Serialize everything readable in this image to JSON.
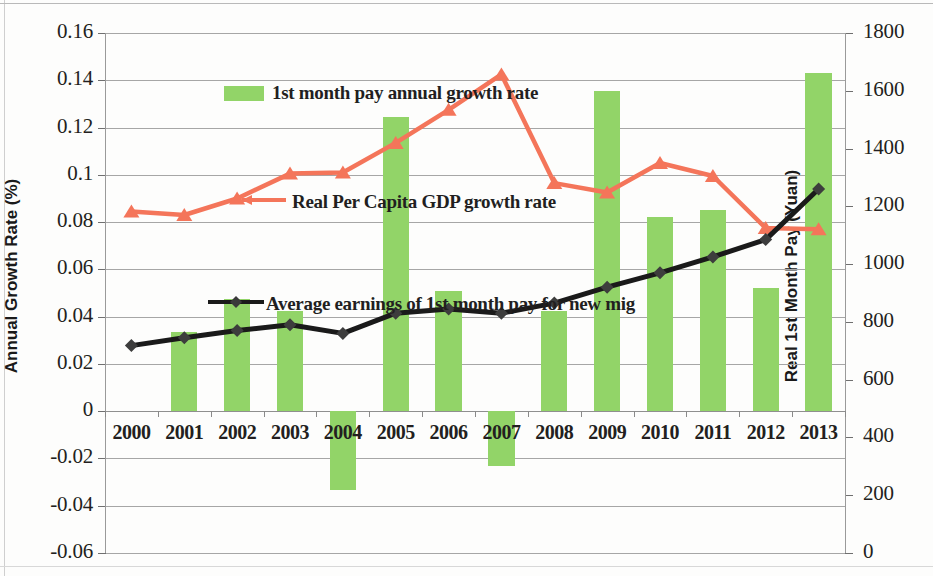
{
  "chart_data": {
    "type": "bar",
    "title": "",
    "categories": [
      "2000",
      "2001",
      "2002",
      "2003",
      "2004",
      "2005",
      "2006",
      "2007",
      "2008",
      "2009",
      "2010",
      "2011",
      "2012",
      "2013"
    ],
    "xlabel": "",
    "ylabel": "Annual Growth Rate (%)",
    "ylabel_right": "Real 1st Month Pay (Yuan)",
    "ylim": [
      -0.06,
      0.16
    ],
    "ylim_right": [
      0,
      1800
    ],
    "yticks": [
      "0.16",
      "0.14",
      "0.12",
      "0.1",
      "0.08",
      "0.06",
      "0.04",
      "0.02",
      "0",
      "-0.02",
      "-0.04",
      "-0.06"
    ],
    "ytick_values": [
      0.16,
      0.14,
      0.12,
      0.1,
      0.08,
      0.06,
      0.04,
      0.02,
      0,
      -0.02,
      -0.04,
      -0.06
    ],
    "yticks_right": [
      "1800",
      "1600",
      "1400",
      "1200",
      "1000",
      "800",
      "600",
      "400",
      "200",
      "0"
    ],
    "ytick_values_right": [
      1800,
      1600,
      1400,
      1200,
      1000,
      800,
      600,
      400,
      200,
      0
    ],
    "grid": true,
    "legend_position": "inline-annotations",
    "series": [
      {
        "name": "1st month pay annual growth rate",
        "type": "bar",
        "axis": "left",
        "color": "#92d468",
        "values": [
          null,
          0.0335,
          0.0475,
          0.0425,
          -0.0335,
          0.1245,
          0.051,
          -0.023,
          0.0425,
          0.1355,
          0.082,
          0.085,
          0.052,
          0.143
        ]
      },
      {
        "name": "Real Per Capita GDP growth rate",
        "type": "line",
        "axis": "left",
        "color": "#f4755a",
        "marker": "triangle",
        "values": [
          0.0845,
          0.083,
          0.09,
          0.1005,
          0.101,
          0.1135,
          0.1275,
          0.1425,
          0.0965,
          0.0925,
          0.105,
          0.0995,
          0.0775,
          0.077
        ]
      },
      {
        "name": "Average earnings of 1st month pay for new mig",
        "type": "line",
        "axis": "right",
        "color": "#1a1a1a",
        "marker": "diamond",
        "values": [
          718,
          745,
          770,
          790,
          760,
          830,
          845,
          830,
          865,
          920,
          970,
          1025,
          1085,
          1260
        ]
      }
    ]
  },
  "annotations": {
    "bar_series_label": "1st month pay annual growth rate",
    "gdp_series_label": "Real Per Capita GDP growth rate",
    "pay_series_label": "Average earnings of 1st month pay for new mig"
  }
}
